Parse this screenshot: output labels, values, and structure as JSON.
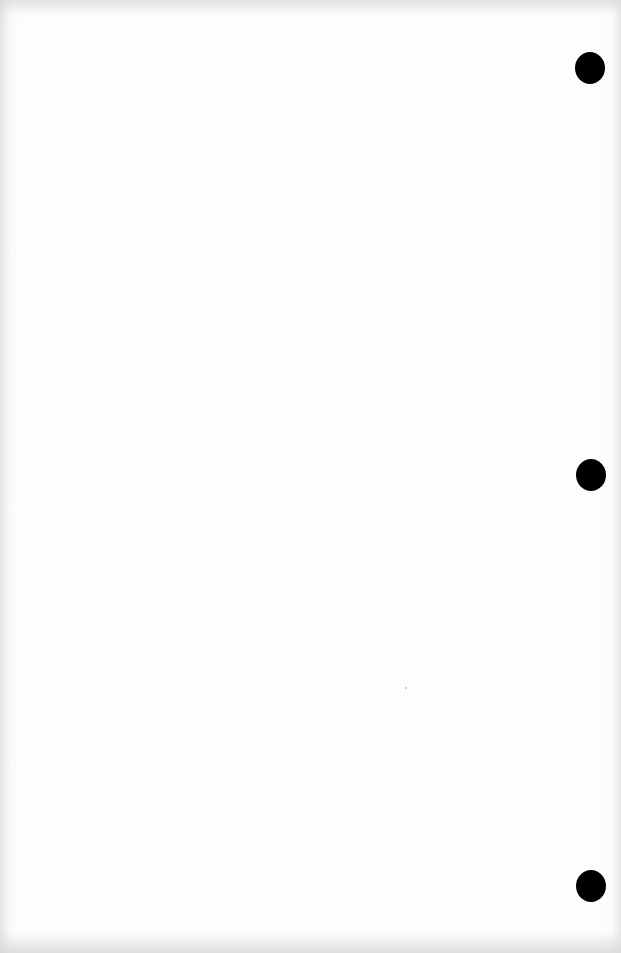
{
  "document": {
    "type": "scanned-page",
    "content": "",
    "paper_color": "#fdfdfd",
    "hole_punches": [
      {
        "name": "top",
        "cx": 590,
        "cy": 68,
        "color": "#000000"
      },
      {
        "name": "middle",
        "cx": 591,
        "cy": 475,
        "color": "#000000"
      },
      {
        "name": "bottom",
        "cx": 591,
        "cy": 886,
        "color": "#000000"
      }
    ]
  }
}
